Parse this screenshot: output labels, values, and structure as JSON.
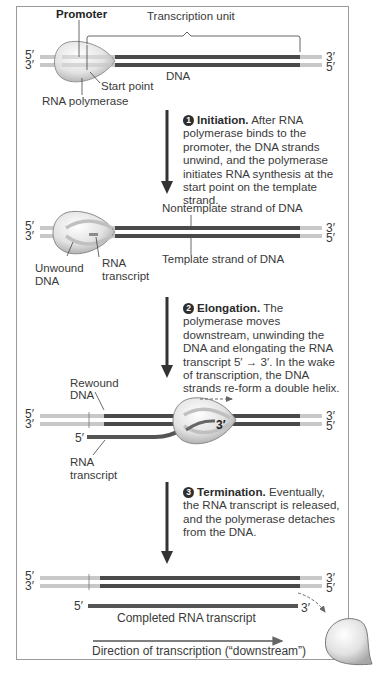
{
  "figure": {
    "colors": {
      "frame": "#9a9a9a",
      "dna_dark": "#4a4a4a",
      "dna_light": "#c8c8c8",
      "polymerase_fill": "#e4e4e4",
      "rna": "#555555",
      "arrow": "#333333"
    },
    "panel1": {
      "promoter_label": "Promoter",
      "transcription_unit_label": "Transcription unit",
      "dna_label": "DNA",
      "start_point_label": "Start point",
      "polymerase_label": "RNA polymerase",
      "left_top": "5′",
      "left_bottom": "3′",
      "right_top": "3′",
      "right_bottom": "5′"
    },
    "step1": {
      "number": "1",
      "title": "Initiation.",
      "text": "After RNA polymerase binds to the promoter, the DNA strands unwind, and the polymerase initiates RNA synthesis at the start point on the template strand."
    },
    "panel2": {
      "nontemplate_label": "Nontemplate strand of DNA",
      "template_label": "Template strand of DNA",
      "unwound_label_1": "Unwound",
      "unwound_label_2": "DNA",
      "rna_label_1": "RNA",
      "rna_label_2": "transcript",
      "left_top": "5′",
      "left_bottom": "3′",
      "right_top": "3′",
      "right_bottom": "5′"
    },
    "step2": {
      "number": "2",
      "title": "Elongation.",
      "text": "The polymerase moves downstream, unwinding the DNA and elongating the RNA transcript 5′ → 3′. In the wake of transcription, the DNA strands re-form a double helix."
    },
    "panel3": {
      "rewound_label_1": "Rewound",
      "rewound_label_2": "DNA",
      "rna_label_1": "RNA",
      "rna_label_2": "transcript",
      "rna_5prime": "5′",
      "rna_3prime": "3′",
      "left_top": "5′",
      "left_bottom": "3′",
      "right_top": "3′",
      "right_bottom": "5′"
    },
    "step3": {
      "number": "3",
      "title": "Termination.",
      "text": "Eventually, the RNA transcript is released, and the polymerase detaches from the DNA."
    },
    "panel4": {
      "left_top": "5′",
      "left_bottom": "3′",
      "right_top": "3′",
      "right_bottom": "5′",
      "rna_5prime": "5′",
      "rna_3prime": "3′",
      "completed_label": "Completed RNA transcript",
      "direction_label": "Direction of transcription (“downstream”)"
    }
  }
}
